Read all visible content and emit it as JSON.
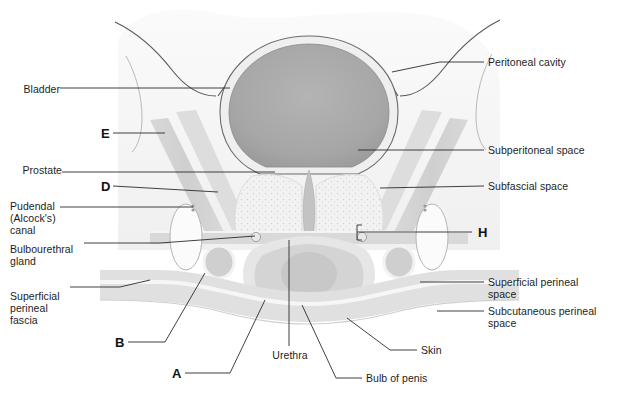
{
  "figure": {
    "style": "grayscale anatomical illustration with leader lines",
    "colors": {
      "background": "#ffffff",
      "outline": "#4a4a4a",
      "bladder_fill": "#a9a9a9",
      "bladder_rim": "#efefef",
      "soft_tissue": "#e4e4e4",
      "muscle_band": "#d2d2d2",
      "perineal_band": "#dcdcdc",
      "leader_line": "#2b2b2b",
      "text": "#1d1d1d"
    }
  },
  "labels_left": [
    {
      "id": "bladder",
      "text": "Bladder",
      "x": 14,
      "y": 83,
      "line_to_x": 230,
      "line_to_y": 88
    },
    {
      "id": "prostate",
      "text": "Prostate",
      "x": 14,
      "y": 164,
      "line_to_x": 275,
      "line_to_y": 172
    },
    {
      "id": "pudendal-canal",
      "text": "Pudendal\n(Alcock's)\ncanal",
      "x": 14,
      "y": 200,
      "line_to_x": 193,
      "line_to_y": 207
    },
    {
      "id": "bulbourethral-gland",
      "text": "Bulbourethral\ngland",
      "x": 14,
      "y": 243,
      "line_to_x": 255,
      "line_to_y": 236
    },
    {
      "id": "superficial-perineal-fascia",
      "text": "Superficial\nperineal\nfascia",
      "x": 14,
      "y": 290,
      "line_to_x": 150,
      "line_to_y": 280
    }
  ],
  "labels_right": [
    {
      "id": "peritoneal-cavity",
      "text": "Peritoneal cavity",
      "x": 487,
      "y": 56,
      "line_to_x": 392,
      "line_to_y": 72
    },
    {
      "id": "subperitoneal-space",
      "text": "Subperitoneal space",
      "x": 487,
      "y": 144,
      "line_to_x": 358,
      "line_to_y": 150
    },
    {
      "id": "subfascial-space",
      "text": "Subfascial space",
      "x": 487,
      "y": 180,
      "line_to_x": 380,
      "line_to_y": 188
    },
    {
      "id": "superficial-perineal-space",
      "text": "Superficial perineal\nspace",
      "x": 487,
      "y": 278,
      "line_to_x": 420,
      "line_to_y": 282
    },
    {
      "id": "subcutaneous-perineal-space",
      "text": "Subcutaneous perineal\nspace",
      "x": 487,
      "y": 307,
      "line_to_x": 437,
      "line_to_y": 311
    },
    {
      "id": "skin",
      "text": "Skin",
      "x": 420,
      "y": 347,
      "line_to_x": 347,
      "line_to_y": 318
    }
  ],
  "labels_bottom": [
    {
      "id": "urethra",
      "text": "Urethra",
      "x": 265,
      "y": 352,
      "line_to_x": 289,
      "line_to_y": 240
    },
    {
      "id": "bulb-of-penis",
      "text": "Bulb of penis",
      "x": 365,
      "y": 376,
      "line_to_x": 302,
      "line_to_y": 305
    }
  ],
  "letters": [
    {
      "id": "E",
      "text": "E",
      "x": 101,
      "y": 127,
      "line_to_x": 165,
      "line_to_y": 133
    },
    {
      "id": "D",
      "text": "D",
      "x": 101,
      "y": 178,
      "line_to_x": 218,
      "line_to_y": 192
    },
    {
      "id": "B",
      "text": "B",
      "x": 115,
      "y": 339,
      "line_to_x": 205,
      "line_to_y": 273
    },
    {
      "id": "A",
      "text": "A",
      "x": 172,
      "y": 369,
      "line_to_x": 265,
      "line_to_y": 300
    },
    {
      "id": "H",
      "text": "H",
      "x": 478,
      "y": 225,
      "line_to_x": 357,
      "line_to_y": 232
    }
  ]
}
